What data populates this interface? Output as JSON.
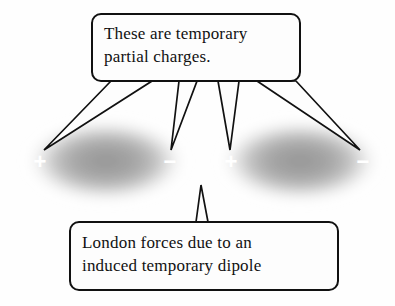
{
  "figure": {
    "title": "London forces due to an induced temporary dipole",
    "width": 395,
    "height": 306,
    "background_color": "#fefefe"
  },
  "callouts": {
    "top": {
      "name": "temporary-partial-charges-callout",
      "line1": "These are temporary",
      "line2": "partial charges.",
      "box": {
        "x": 92,
        "y": 14,
        "width": 208,
        "height": 67,
        "radius": 9
      },
      "fill_color": "#fdfdfd",
      "stroke_color": "#1a1a1a"
    },
    "bottom": {
      "name": "london-forces-callout",
      "line1": "London forces due to an",
      "line2": "induced temporary dipole",
      "box": {
        "x": 70,
        "y": 222,
        "width": 268,
        "height": 68,
        "radius": 9
      },
      "fill_color": "#fdfdfd",
      "stroke_color": "#1a1a1a"
    }
  },
  "clouds": [
    {
      "name": "electron-cloud-left",
      "cx": 106,
      "cy": 161,
      "rx": 86,
      "ry": 46,
      "color": "#6e6e6e",
      "label": "left atom electron cloud"
    },
    {
      "name": "electron-cloud-right",
      "cx": 300,
      "cy": 161,
      "rx": 86,
      "ry": 46,
      "color": "#6e6e6e",
      "label": "right atom electron cloud"
    }
  ],
  "charges": [
    {
      "name": "charge-left-positive",
      "symbol": "+",
      "x": 40,
      "y": 163,
      "sign": "positive"
    },
    {
      "name": "charge-left-negative",
      "symbol": "−",
      "x": 170,
      "y": 163,
      "sign": "negative"
    },
    {
      "name": "charge-right-positive",
      "symbol": "+",
      "x": 231,
      "y": 163,
      "sign": "positive"
    },
    {
      "name": "charge-right-negative",
      "symbol": "−",
      "x": 363,
      "y": 163,
      "sign": "negative"
    }
  ],
  "leader_lines": {
    "name": "callout-leader-lines",
    "stroke_color": "#111111",
    "top_pointers": [
      {
        "target_charge": "charge-left-positive",
        "base_left": 111,
        "base_right": 152,
        "tip_x": 44,
        "tip_y": 150
      },
      {
        "target_charge": "charge-left-negative",
        "base_left": 179,
        "base_right": 197,
        "tip_x": 171,
        "tip_y": 150
      },
      {
        "target_charge": "charge-right-positive",
        "base_left": 218,
        "base_right": 239,
        "tip_x": 230,
        "tip_y": 150
      },
      {
        "target_charge": "charge-right-negative",
        "base_left": 257,
        "base_right": 296,
        "tip_x": 360,
        "tip_y": 150
      }
    ],
    "bottom_pointer": {
      "base_left": 196,
      "base_right": 208,
      "tip_x": 201,
      "tip_y": 185
    }
  }
}
